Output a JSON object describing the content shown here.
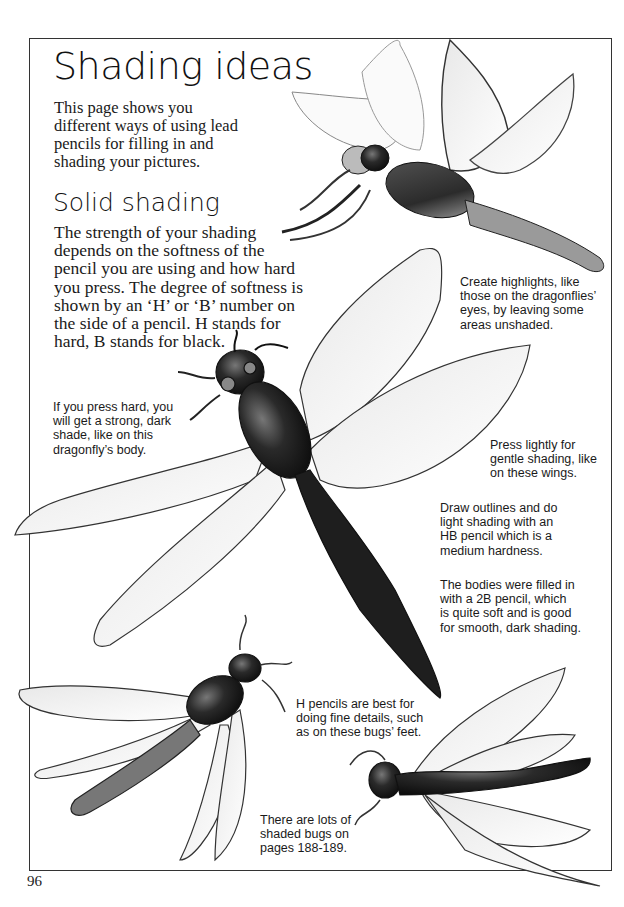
{
  "page": {
    "title": "Shading ideas",
    "intro_lines": [
      "This page shows you",
      "different ways of using lead",
      "pencils for filling in and",
      "shading your pictures."
    ],
    "section_heading": "Solid shading",
    "section_body_lines": [
      "The strength of your shading",
      "depends on the softness of the",
      "pencil you are using and how hard",
      "you press. The degree of softness is",
      "shown by an ‘H’ or ‘B’ number on",
      "the side of a pencil. H stands for",
      "hard, B stands for black."
    ],
    "page_number": "96"
  },
  "captions": {
    "highlights": [
      "Create highlights, like",
      "those on the dragonflies’",
      "eyes, by leaving some",
      "areas unshaded."
    ],
    "press_hard": [
      "If you press hard, you",
      "will get a strong, dark",
      "shade, like on this",
      "dragonfly’s body."
    ],
    "press_lightly": [
      "Press lightly for",
      "gentle shading, like",
      "on these wings."
    ],
    "hb_pencil": [
      "Draw outlines and do",
      "light shading with an",
      "HB pencil which is a",
      "medium hardness."
    ],
    "2b_pencil": [
      "The bodies were filled in",
      "with a 2B pencil, which",
      "is quite soft and is good",
      "for smooth, dark shading."
    ],
    "h_pencil": [
      "H pencils are best for",
      "doing fine details, such",
      "as on these bugs’ feet."
    ],
    "more_bugs": [
      "There are lots of",
      "shaded bugs on",
      "pages 188-189."
    ]
  },
  "illustrations": [
    {
      "name": "dragonfly-top-right",
      "description": "Pencil-shaded dragonfly flying right, top of page"
    },
    {
      "name": "dragonfly-center",
      "description": "Large dragonfly with dark shaded body and light wings, center"
    },
    {
      "name": "bug-bottom-left",
      "description": "Shaded winged bug, bottom left"
    },
    {
      "name": "bug-bottom-right",
      "description": "Shaded winged bug, bottom right"
    }
  ],
  "colors": {
    "ink": "#1a1a1a",
    "frame": "#333333",
    "paper": "#ffffff"
  }
}
